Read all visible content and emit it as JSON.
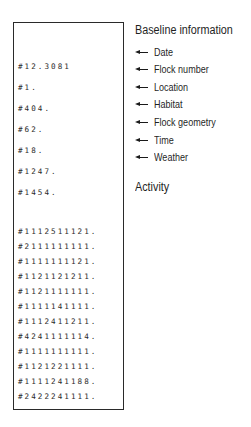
{
  "printout": {
    "baseline_lines": [
      "#12.3081",
      "#1.",
      "#404.",
      "#62.",
      "#18.",
      "#1247.",
      "#1454."
    ],
    "activity_lines": [
      "#1112511121.",
      "#2111111111.",
      "#1111111121.",
      "#1121121211.",
      "#1121111111.",
      "#1111141111.",
      "#1112411211.",
      "#4241111114.",
      "#1111111111.",
      "#1121221111.",
      "#1111241188.",
      "#2422241111."
    ]
  },
  "annotations": {
    "baseline_title": "Baseline information",
    "baseline_labels": [
      "Date",
      "Flock number",
      "Location",
      "Habitat",
      "Flock geometry",
      "Time",
      "Weather"
    ],
    "activity_title": "Activity",
    "arrow_icon": "left-arrow"
  }
}
